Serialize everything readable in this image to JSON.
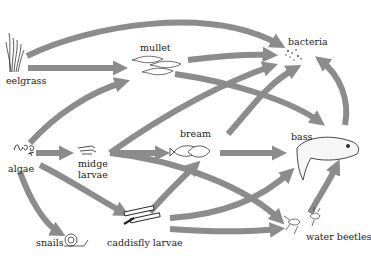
{
  "diagram": {
    "title": "",
    "type": "food-web",
    "arrow_color": "#8c8c8c",
    "nodes": [
      {
        "id": "eelgrass",
        "label": "eelgrass"
      },
      {
        "id": "mullet",
        "label": "mullet"
      },
      {
        "id": "bacteria",
        "label": "bacteria"
      },
      {
        "id": "algae",
        "label": "algae"
      },
      {
        "id": "midge",
        "label_line1": "midge",
        "label_line2": "larvae"
      },
      {
        "id": "bream",
        "label": "bream"
      },
      {
        "id": "bass",
        "label": "bass"
      },
      {
        "id": "snails",
        "label": "snails"
      },
      {
        "id": "caddisfly",
        "label": "caddisfly larvae"
      },
      {
        "id": "beetles",
        "label": "water beetles"
      }
    ],
    "edges": [
      {
        "from": "eelgrass",
        "to": "mullet"
      },
      {
        "from": "eelgrass",
        "to": "bacteria"
      },
      {
        "from": "algae",
        "to": "mullet"
      },
      {
        "from": "algae",
        "to": "midge larvae"
      },
      {
        "from": "algae",
        "to": "snails"
      },
      {
        "from": "algae",
        "to": "caddisfly larvae"
      },
      {
        "from": "mullet",
        "to": "bacteria"
      },
      {
        "from": "mullet",
        "to": "bass"
      },
      {
        "from": "midge larvae",
        "to": "bream"
      },
      {
        "from": "midge larvae",
        "to": "bacteria"
      },
      {
        "from": "midge larvae",
        "to": "water beetles"
      },
      {
        "from": "bream",
        "to": "bass"
      },
      {
        "from": "bream",
        "to": "bacteria"
      },
      {
        "from": "caddisfly larvae",
        "to": "bream"
      },
      {
        "from": "caddisfly larvae",
        "to": "bass"
      },
      {
        "from": "caddisfly larvae",
        "to": "water beetles"
      },
      {
        "from": "water beetles",
        "to": "bass"
      },
      {
        "from": "bass",
        "to": "bacteria"
      }
    ]
  }
}
